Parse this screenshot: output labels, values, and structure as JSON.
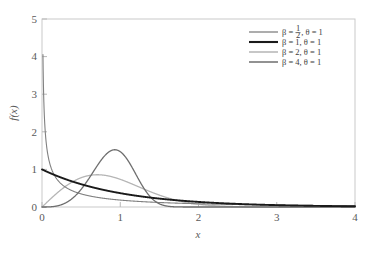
{
  "chart_data": {
    "type": "line",
    "title": "",
    "xlabel": "x",
    "ylabel": "f(x)",
    "xlim": [
      0,
      4
    ],
    "ylim": [
      0,
      5
    ],
    "xticks": [
      "0",
      "1",
      "2",
      "3",
      "4"
    ],
    "yticks": [
      "0",
      "1",
      "2",
      "3",
      "4",
      "5"
    ],
    "xtick_values": [
      0,
      1,
      2,
      3,
      4
    ],
    "ytick_values": [
      0,
      1,
      2,
      3,
      4,
      5
    ],
    "grid": false,
    "legend_position": "top-right",
    "distribution": "Weibull probability density function",
    "series": [
      {
        "name": "beta-one-half",
        "label_beta": "β = ",
        "label_beta_num": "1",
        "label_beta_den": "2",
        "label_theta": ", θ = 1",
        "beta": 0.5,
        "theta": 1,
        "color": "#808080",
        "width": 1.1,
        "peak_y": 4.5,
        "peak_x": 0.015,
        "x": [
          0.012,
          0.03,
          0.05,
          0.1,
          0.2,
          0.3,
          0.4,
          0.5,
          0.7,
          1.0,
          1.5,
          2.0,
          2.5,
          3.0,
          3.5,
          4.0
        ],
        "y": [
          4.06,
          2.43,
          1.77,
          1.14,
          0.71,
          0.52,
          0.41,
          0.34,
          0.25,
          0.18,
          0.12,
          0.084,
          0.061,
          0.046,
          0.036,
          0.028
        ]
      },
      {
        "name": "beta-one",
        "label": "β = 1, θ = 1",
        "beta": 1,
        "theta": 1,
        "color": "#1a1a1a",
        "width": 1.9,
        "peak_y": 1.0,
        "peak_x": 0,
        "x": [
          0,
          0.25,
          0.5,
          0.75,
          1.0,
          1.5,
          2.0,
          2.5,
          3.0,
          3.5,
          4.0
        ],
        "y": [
          1.0,
          0.779,
          0.607,
          0.472,
          0.368,
          0.223,
          0.135,
          0.082,
          0.05,
          0.03,
          0.018
        ]
      },
      {
        "name": "beta-two",
        "label": "β = 2, θ = 1",
        "beta": 2,
        "theta": 1,
        "color": "#b5b5b5",
        "width": 1.3,
        "peak_y": 0.858,
        "peak_x": 0.707,
        "x": [
          0,
          0.25,
          0.5,
          0.707,
          1.0,
          1.25,
          1.5,
          2.0,
          2.5,
          3.0,
          3.5,
          4.0
        ],
        "y": [
          0,
          0.47,
          0.779,
          0.858,
          0.736,
          0.527,
          0.316,
          0.073,
          0.0078,
          0.0004,
          0.0,
          0.0
        ]
      },
      {
        "name": "beta-four",
        "label": "β = 4, θ = 1",
        "beta": 4,
        "theta": 1,
        "color": "#6e6e6e",
        "width": 1.3,
        "peak_y": 1.517,
        "peak_x": 0.931,
        "x": [
          0,
          0.25,
          0.5,
          0.75,
          0.931,
          1.1,
          1.25,
          1.5,
          1.75,
          2.0
        ],
        "y": [
          0,
          0.062,
          0.484,
          1.219,
          1.517,
          1.33,
          0.931,
          0.258,
          0.0227,
          0.0005
        ]
      }
    ]
  }
}
